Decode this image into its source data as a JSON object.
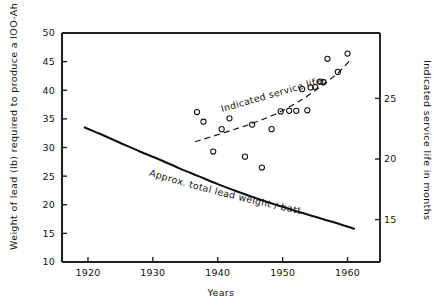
{
  "chart_data": {
    "type": "scatter",
    "title": "",
    "xlabel": "Years",
    "ylabel": "Weight of lead (lb) required to produce a lOO-Ah battery",
    "y2label": "Indicated service life in months",
    "xlim": [
      1916,
      1965
    ],
    "ylim": [
      10,
      50
    ],
    "y2lim": [
      11.5,
      30.4
    ],
    "grid": false,
    "legend_position": "none",
    "xticks": [
      1920,
      1930,
      1940,
      1950,
      1960
    ],
    "xtick_labels": [
      "1920",
      "1930",
      "1940",
      "1950",
      "1960"
    ],
    "yticks": [
      10,
      15,
      20,
      25,
      30,
      35,
      40,
      45,
      50
    ],
    "ytick_labels": [
      "10",
      "15",
      "20",
      "25",
      "30",
      "35",
      "40",
      "45",
      "50"
    ],
    "y2ticks": [
      15,
      20,
      25
    ],
    "y2tick_labels": [
      "15",
      "20",
      "25"
    ],
    "series": [
      {
        "name": "Approx. total lead weight / battery",
        "type": "line",
        "style": "solid",
        "axis": "left",
        "annotation": "Approx. total lead weight / battery",
        "x": [
          1919.5,
          1922,
          1925,
          1928,
          1931,
          1934,
          1937,
          1940,
          1943,
          1946,
          1949,
          1952,
          1955,
          1958,
          1961
        ],
        "values": [
          33.5,
          32.3,
          30.8,
          29.3,
          27.9,
          26.4,
          25.0,
          23.6,
          22.3,
          21.1,
          20.0,
          18.9,
          17.9,
          16.9,
          15.8
        ]
      },
      {
        "name": "Indicated service life",
        "type": "line",
        "style": "dashed",
        "axis": "left",
        "annotation": "Indicated service life",
        "x": [
          1936.5,
          1941,
          1945,
          1949,
          1953,
          1956,
          1958.5,
          1960.5
        ],
        "values": [
          31.0,
          32.6,
          34.1,
          35.9,
          38.4,
          40.8,
          43.0,
          45.4
        ]
      },
      {
        "name": "Indicated service life observations",
        "type": "scatter",
        "axis": "left",
        "marker": "open-circle",
        "points": [
          {
            "x": 1936.8,
            "y": 36.2
          },
          {
            "x": 1937.8,
            "y": 34.5
          },
          {
            "x": 1939.3,
            "y": 29.3
          },
          {
            "x": 1940.6,
            "y": 33.2
          },
          {
            "x": 1941.8,
            "y": 35.1
          },
          {
            "x": 1944.2,
            "y": 28.4
          },
          {
            "x": 1945.3,
            "y": 34.0
          },
          {
            "x": 1946.8,
            "y": 26.5
          },
          {
            "x": 1948.3,
            "y": 33.2
          },
          {
            "x": 1949.7,
            "y": 36.3
          },
          {
            "x": 1951.0,
            "y": 36.4
          },
          {
            "x": 1952.1,
            "y": 36.4
          },
          {
            "x": 1953.0,
            "y": 40.2
          },
          {
            "x": 1953.8,
            "y": 36.5
          },
          {
            "x": 1954.3,
            "y": 40.5
          },
          {
            "x": 1955.0,
            "y": 40.6
          },
          {
            "x": 1955.8,
            "y": 41.5
          },
          {
            "x": 1956.3,
            "y": 41.4
          },
          {
            "x": 1956.9,
            "y": 45.5
          },
          {
            "x": 1958.5,
            "y": 43.2
          },
          {
            "x": 1960.0,
            "y": 46.4
          }
        ]
      }
    ]
  },
  "axes": {
    "x_title": "Years",
    "y_left_title": "Weight of lead (lb) required to produce a lOO-Ah battery",
    "y_right_title": "Indicated service life in months"
  },
  "annotations": {
    "trend_label": "Indicated service life",
    "curve_label": "Approx. total lead weight / battery"
  },
  "colors": {
    "ink": "#111111",
    "background": "#ffffff"
  }
}
